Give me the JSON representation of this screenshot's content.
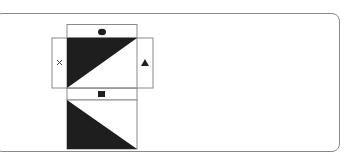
{
  "diagram": {
    "markers": {
      "top": "circle",
      "left": "cross",
      "right": "triangle",
      "middle": "square"
    },
    "colors": {
      "fill": "#1e1e1e",
      "stroke": "#8a8a8a",
      "frame": "#8a8a8a"
    }
  }
}
